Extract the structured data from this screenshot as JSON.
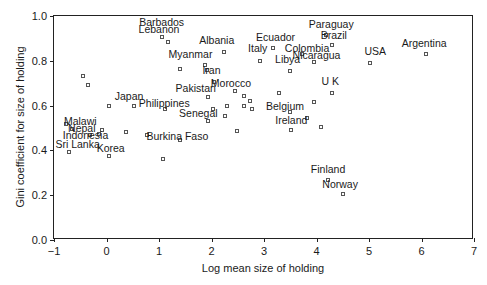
{
  "chart_data": {
    "type": "scatter",
    "title": "",
    "xlabel": "Log mean size of holding",
    "ylabel": "Gini coefficient for size of holding",
    "xlim": [
      -1,
      7
    ],
    "ylim": [
      0.0,
      1.0
    ],
    "xticks": [
      "−1",
      "0",
      "1",
      "2",
      "3",
      "4",
      "5",
      "6",
      "7"
    ],
    "xtick_values": [
      -1,
      0,
      1,
      2,
      3,
      4,
      5,
      6,
      7
    ],
    "yticks": [
      "0.0",
      "0.2",
      "0.4",
      "0.6",
      "0.8",
      "1.0"
    ],
    "ytick_values": [
      0.0,
      0.2,
      0.4,
      0.6,
      0.8,
      1.0
    ],
    "grid": false,
    "legend": "none",
    "marker": "open-square",
    "marker_color": "#555555",
    "frame_color": "#222222",
    "points": [
      {
        "label": "Barbados",
        "x": 1.05,
        "y": 0.905,
        "lx": 1.05,
        "ly": 0.975
      },
      {
        "label": "Lebanon",
        "x": 1.17,
        "y": 0.885,
        "lx": 1.0,
        "ly": 0.94
      },
      {
        "label": "Albania",
        "x": 2.23,
        "y": 0.84,
        "lx": 2.1,
        "ly": 0.895
      },
      {
        "label": "Ecuador",
        "x": 3.18,
        "y": 0.855,
        "lx": 3.22,
        "ly": 0.905
      },
      {
        "label": "Paraguay",
        "x": 4.18,
        "y": 0.915,
        "lx": 4.28,
        "ly": 0.965
      },
      {
        "label": "Brazil",
        "x": 4.3,
        "y": 0.87,
        "lx": 4.33,
        "ly": 0.915
      },
      {
        "label": "Italy",
        "x": 2.93,
        "y": 0.8,
        "lx": 2.88,
        "ly": 0.855
      },
      {
        "label": "Myanmar",
        "x": 1.87,
        "y": 0.78,
        "lx": 1.6,
        "ly": 0.83
      },
      {
        "label": "Libya",
        "x": 3.5,
        "y": 0.755,
        "lx": 3.45,
        "ly": 0.81
      },
      {
        "label": "Colombia",
        "x": 3.72,
        "y": 0.83,
        "lx": 3.82,
        "ly": 0.855
      },
      {
        "label": "Nicaragua",
        "x": 3.95,
        "y": 0.795,
        "lx": 4.0,
        "ly": 0.825
      },
      {
        "label": "Argentina",
        "x": 6.08,
        "y": 0.83,
        "lx": 6.05,
        "ly": 0.88
      },
      {
        "label": "USA",
        "x": 5.02,
        "y": 0.79,
        "lx": 5.12,
        "ly": 0.845
      },
      {
        "label": "Iran",
        "x": 2.05,
        "y": 0.705,
        "lx": 2.0,
        "ly": 0.76
      },
      {
        "label": "Morocco",
        "x": 2.45,
        "y": 0.665,
        "lx": 2.37,
        "ly": 0.7
      },
      {
        "label": "Pakistan",
        "x": 1.93,
        "y": 0.64,
        "lx": 1.7,
        "ly": 0.68
      },
      {
        "label": "Japan",
        "x": 0.52,
        "y": 0.6,
        "lx": 0.43,
        "ly": 0.645
      },
      {
        "label": "Philippines",
        "x": 1.12,
        "y": 0.585,
        "lx": 1.1,
        "ly": 0.61
      },
      {
        "label": "Senegal",
        "x": 1.93,
        "y": 0.53,
        "lx": 1.75,
        "ly": 0.565
      },
      {
        "label": "Belgium",
        "x": 3.5,
        "y": 0.57,
        "lx": 3.4,
        "ly": 0.6
      },
      {
        "label": "U K",
        "x": 4.3,
        "y": 0.655,
        "lx": 4.26,
        "ly": 0.71
      },
      {
        "label": "Ireland",
        "x": 3.52,
        "y": 0.49,
        "lx": 3.52,
        "ly": 0.535
      },
      {
        "label": "Malawi",
        "x": -0.78,
        "y": 0.52,
        "lx": -0.5,
        "ly": 0.53
      },
      {
        "label": "Nepal",
        "x": -0.65,
        "y": 0.495,
        "lx": -0.47,
        "ly": 0.5
      },
      {
        "label": "Indonesia",
        "x": -0.32,
        "y": 0.47,
        "lx": -0.4,
        "ly": 0.47
      },
      {
        "label": "Sri Lanka",
        "x": -0.72,
        "y": 0.395,
        "lx": -0.55,
        "ly": 0.43
      },
      {
        "label": "Korea",
        "x": 0.05,
        "y": 0.375,
        "lx": 0.08,
        "ly": 0.41
      },
      {
        "label": "Burkina Faso",
        "x": 1.4,
        "y": 0.445,
        "lx": 1.35,
        "ly": 0.465
      },
      {
        "label": "Finland",
        "x": 4.22,
        "y": 0.27,
        "lx": 4.22,
        "ly": 0.315
      },
      {
        "label": "Norway",
        "x": 4.5,
        "y": 0.205,
        "lx": 4.45,
        "ly": 0.25
      },
      {
        "label": "",
        "x": -0.45,
        "y": 0.73
      },
      {
        "label": "",
        "x": -0.35,
        "y": 0.69
      },
      {
        "label": "",
        "x": 1.4,
        "y": 0.765
      },
      {
        "label": "",
        "x": 1.92,
        "y": 0.76
      },
      {
        "label": "",
        "x": 2.62,
        "y": 0.645
      },
      {
        "label": "",
        "x": 2.73,
        "y": 0.62
      },
      {
        "label": "",
        "x": 2.62,
        "y": 0.6
      },
      {
        "label": "",
        "x": 2.78,
        "y": 0.585
      },
      {
        "label": "",
        "x": 2.3,
        "y": 0.6
      },
      {
        "label": "",
        "x": 2.02,
        "y": 0.585
      },
      {
        "label": "",
        "x": 2.25,
        "y": 0.555
      },
      {
        "label": "",
        "x": 3.28,
        "y": 0.655
      },
      {
        "label": "",
        "x": 0.05,
        "y": 0.6
      },
      {
        "label": "",
        "x": -0.15,
        "y": 0.475
      },
      {
        "label": "",
        "x": -0.08,
        "y": 0.49
      },
      {
        "label": "",
        "x": 0.38,
        "y": 0.48
      },
      {
        "label": "",
        "x": 0.78,
        "y": 0.47
      },
      {
        "label": "",
        "x": 1.08,
        "y": 0.36
      },
      {
        "label": "",
        "x": 2.48,
        "y": 0.485
      },
      {
        "label": "",
        "x": 3.95,
        "y": 0.615
      },
      {
        "label": "",
        "x": 3.82,
        "y": 0.545
      },
      {
        "label": "",
        "x": 4.08,
        "y": 0.505
      }
    ]
  }
}
